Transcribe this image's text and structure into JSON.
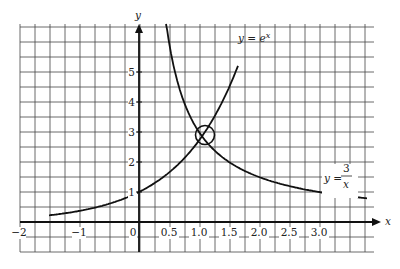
{
  "chart_data": {
    "type": "line",
    "title": "",
    "xlabel": "x",
    "ylabel": "y",
    "x_tick_labels": [
      "−2",
      "−1",
      "0",
      "0.5",
      "1.0",
      "1.5",
      "2.0",
      "2.5",
      "3.0"
    ],
    "x_tick_values": [
      -2,
      -1,
      0,
      0.5,
      1.0,
      1.5,
      2.0,
      2.5,
      3.0
    ],
    "y_tick_labels": [
      "1",
      "2",
      "3",
      "4",
      "5"
    ],
    "y_tick_values": [
      1,
      2,
      3,
      4,
      5
    ],
    "xlim": [
      -2,
      3.9
    ],
    "ylim": [
      -1,
      6.6
    ],
    "grid": true,
    "grid_spacing": {
      "x": 0.25,
      "y": 0.5
    },
    "series": [
      {
        "name": "y = e^x",
        "label": "y = e",
        "label_sup": "x",
        "x_range": [
          -1.5,
          1.65
        ],
        "points": [
          [
            -1.5,
            0.22
          ],
          [
            -1.0,
            0.37
          ],
          [
            -0.5,
            0.61
          ],
          [
            0,
            1.0
          ],
          [
            0.5,
            1.65
          ],
          [
            1.0,
            2.72
          ],
          [
            1.5,
            4.48
          ],
          [
            1.65,
            5.21
          ]
        ]
      },
      {
        "name": "y = 3/x",
        "label": "y =",
        "label_num": "3",
        "label_den": "x",
        "x_range": [
          0.45,
          3.8
        ],
        "points": [
          [
            0.45,
            6.67
          ],
          [
            0.5,
            6.0
          ],
          [
            0.75,
            4.0
          ],
          [
            1.0,
            3.0
          ],
          [
            1.5,
            2.0
          ],
          [
            2.0,
            1.5
          ],
          [
            2.5,
            1.2
          ],
          [
            3.0,
            1.0
          ],
          [
            3.8,
            0.79
          ]
        ]
      }
    ],
    "annotations": [
      {
        "type": "circle",
        "x": 1.1,
        "y": 2.9,
        "description": "intersection of y = e^x and y = 3/x"
      }
    ]
  }
}
